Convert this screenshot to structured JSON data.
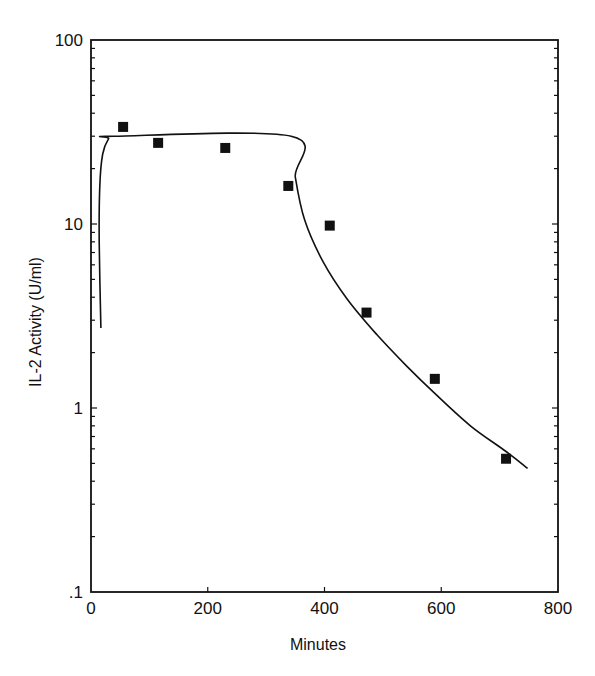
{
  "chart_data": {
    "type": "scatter",
    "title": "",
    "xlabel": "Minutes",
    "ylabel": "IL-2 Activity (U/ml)",
    "xlim": [
      0,
      800
    ],
    "ylim": [
      0.1,
      100
    ],
    "yscale": "log",
    "grid": false,
    "legend": null,
    "x_ticks": [
      0,
      200,
      400,
      600,
      800
    ],
    "x_tick_labels": [
      "0",
      "200",
      "400",
      "600",
      "800"
    ],
    "y_ticks": [
      0.1,
      1,
      10,
      100
    ],
    "y_tick_labels": [
      ".1",
      "1",
      "10",
      "100"
    ],
    "series": [
      {
        "name": "Measured IL-2 activity",
        "kind": "markers",
        "marker": "filled-square",
        "color": "#111111",
        "x": [
          55,
          115,
          230,
          338,
          409,
          472,
          589,
          711
        ],
        "y": [
          33.7,
          27.6,
          25.9,
          16.1,
          9.8,
          3.3,
          1.44,
          0.53
        ]
      },
      {
        "name": "Model fit",
        "kind": "line",
        "color": "#111111",
        "x": [
          17,
          14,
          15,
          20,
          30,
          40,
          343,
          350,
          366,
          398,
          439,
          490,
          540,
          589,
          650,
          711,
          748
        ],
        "y": [
          2.72,
          8.0,
          16.0,
          24.0,
          29.0,
          30.0,
          30.0,
          18.0,
          10.5,
          6.2,
          3.9,
          2.5,
          1.7,
          1.2,
          0.8,
          0.58,
          0.47
        ]
      }
    ]
  }
}
